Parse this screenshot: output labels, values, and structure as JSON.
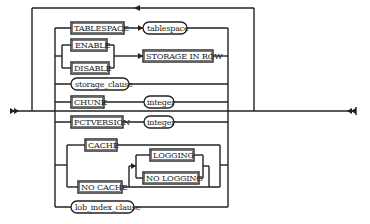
{
  "diagram": {
    "type": "syntax-railroad-diagram",
    "colors": {
      "line": "#222222",
      "background": "#ffffff"
    },
    "start_marker": "double-arrow-right",
    "end_marker": "double-arrow-left",
    "loop_back": true,
    "branches": [
      {
        "id": "tablespace",
        "keyword": "TABLESPACE",
        "argument": "tablespace"
      },
      {
        "id": "storage-in-row",
        "choices": [
          "ENABLE",
          "DISABLE"
        ],
        "keyword": "STORAGE IN ROW"
      },
      {
        "id": "storage-clause",
        "nonterminal": "storage_clause"
      },
      {
        "id": "chunk",
        "keyword": "CHUNK",
        "argument": "integer"
      },
      {
        "id": "pctversion",
        "keyword": "PCTVERSION",
        "argument": "integer"
      },
      {
        "id": "cache",
        "choices": [
          "CACHE",
          "NO CACHE"
        ],
        "sub_choices": [
          "LOGGING",
          "NO LOGGING"
        ]
      },
      {
        "id": "lob-index-clause",
        "nonterminal": "lob_index_clause"
      }
    ]
  },
  "labels": {
    "tablespace_kw": "TABLESPACE",
    "tablespace_arg": "tablespace",
    "enable": "ENABLE",
    "disable": "DISABLE",
    "storage_in_row": "STORAGE IN ROW",
    "storage_clause": "storage_clause",
    "chunk": "CHUNK",
    "chunk_arg": "integer",
    "pctversion": "PCTVERSION",
    "pctversion_arg": "integer",
    "cache": "CACHE",
    "no_cache": "NO CACHE",
    "logging": "LOGGING",
    "no_logging": "NO LOGGING",
    "lob_index_clause": "lob_index_clause"
  }
}
